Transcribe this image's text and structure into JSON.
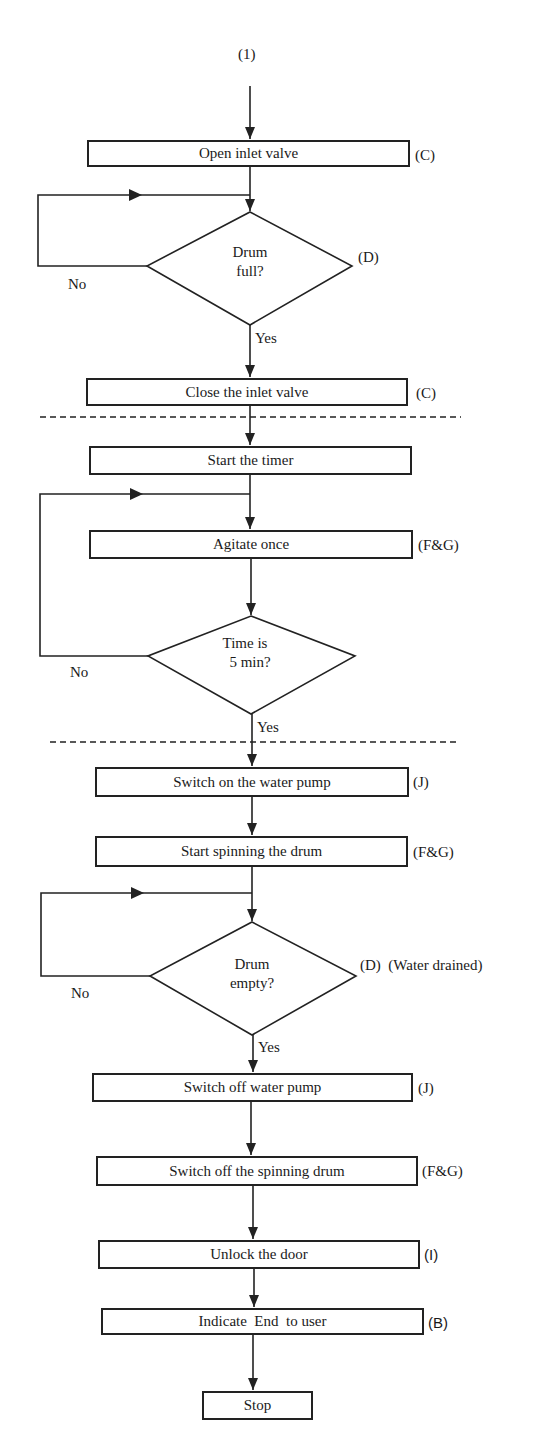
{
  "diagram": {
    "type": "flowchart",
    "start_connector": "(1)",
    "steps": [
      {
        "id": "open_inlet",
        "label": "Open inlet valve",
        "tag": "(C)"
      },
      {
        "id": "drum_full",
        "kind": "decision",
        "line1": "Drum",
        "line2": "full?",
        "tag": "(D)",
        "no": "No",
        "yes": "Yes"
      },
      {
        "id": "close_inlet",
        "label": "Close the inlet valve",
        "tag": "(C)"
      },
      {
        "id": "start_timer",
        "label": "Start the timer",
        "tag": ""
      },
      {
        "id": "agitate",
        "label": "Agitate once",
        "tag": "(F&G)"
      },
      {
        "id": "time_check",
        "kind": "decision",
        "line1": "Time is",
        "line2": "5 min?",
        "tag": "",
        "no": "No",
        "yes": "Yes"
      },
      {
        "id": "pump_on",
        "label": "Switch on the water pump",
        "tag": "(J)"
      },
      {
        "id": "spin_start",
        "label": "Start spinning the drum",
        "tag": "(F&G)"
      },
      {
        "id": "drum_empty",
        "kind": "decision",
        "line1": "Drum",
        "line2": "empty?",
        "tag": "(D)  (Water drained)",
        "no": "No",
        "yes": "Yes"
      },
      {
        "id": "pump_off",
        "label": "Switch off water pump",
        "tag": "(J)"
      },
      {
        "id": "spin_off",
        "label": "Switch off the spinning drum",
        "tag": "(F&G)"
      },
      {
        "id": "unlock",
        "label": "Unlock the door",
        "tag": "(I)"
      },
      {
        "id": "indicate_end",
        "label": "Indicate  End  to user",
        "tag": "(B)"
      },
      {
        "id": "stop",
        "label": "Stop",
        "tag": ""
      }
    ],
    "colors": {
      "line": "#222222",
      "background": "#ffffff"
    }
  }
}
